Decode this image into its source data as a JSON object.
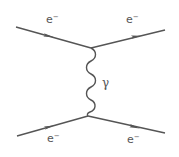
{
  "diagram": {
    "colors": {
      "line": "#555555",
      "background": "#ffffff"
    },
    "vertices": [
      {
        "id": "upper",
        "x": 91,
        "y": 48
      },
      {
        "id": "lower",
        "x": 88,
        "y": 116
      }
    ],
    "fermion_lines": [
      {
        "id": "incoming-top",
        "from": [
          16,
          27
        ],
        "to": [
          91,
          48
        ],
        "arrow_at": [
          50,
          37
        ],
        "label": "e",
        "label_sup": "−"
      },
      {
        "id": "outgoing-top",
        "from": [
          91,
          48
        ],
        "to": [
          165,
          30
        ],
        "arrow_at": [
          137,
          37
        ],
        "label": "e",
        "label_sup": "−"
      },
      {
        "id": "incoming-bottom",
        "from": [
          17,
          136
        ],
        "to": [
          88,
          116
        ],
        "arrow_at": [
          50,
          127
        ],
        "label": "e",
        "label_sup": "−"
      },
      {
        "id": "outgoing-bottom",
        "from": [
          88,
          116
        ],
        "to": [
          165,
          133
        ],
        "arrow_at": [
          136,
          127
        ],
        "label": "e",
        "label_sup": "−"
      }
    ],
    "photon": {
      "label": "γ",
      "from": [
        91,
        48
      ],
      "to": [
        88,
        116
      ]
    },
    "labels": {
      "top_left": {
        "text": "e",
        "sup": "−"
      },
      "top_right": {
        "text": "e",
        "sup": "−"
      },
      "bottom_left": {
        "text": "e",
        "sup": "−"
      },
      "bottom_right": {
        "text": "e",
        "sup": "−"
      },
      "photon": "γ"
    }
  }
}
